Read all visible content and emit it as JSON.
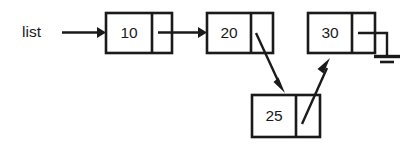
{
  "figure": {
    "kind": "linked-list-diagram",
    "background_color": "#ffffff",
    "ink_color": "#1a1a1a",
    "head_label": "list"
  },
  "nodes": [
    {
      "id": "node-10",
      "value": "10",
      "x": 106,
      "y": 13,
      "w": 66,
      "h": 40,
      "divider_x": 152
    },
    {
      "id": "node-20",
      "value": "20",
      "x": 207,
      "y": 13,
      "w": 66,
      "h": 40,
      "divider_x": 251
    },
    {
      "id": "node-30",
      "value": "30",
      "x": 308,
      "y": 13,
      "w": 67,
      "h": 40,
      "divider_x": 352
    },
    {
      "id": "node-25",
      "value": "25",
      "x": 252,
      "y": 95,
      "w": 68,
      "h": 42,
      "divider_x": 296
    }
  ],
  "links": [
    {
      "id": "link-head-to-10",
      "from": "list-label",
      "to": "node-10"
    },
    {
      "id": "link-10-to-20",
      "from": "node-10",
      "to": "node-20"
    },
    {
      "id": "link-20-to-25",
      "from": "node-20",
      "to": "node-25"
    },
    {
      "id": "link-25-to-30",
      "from": "node-25",
      "to": "node-30"
    }
  ],
  "terminator": {
    "id": "ground-symbol",
    "attached_to": "node-30",
    "meaning": "null"
  }
}
